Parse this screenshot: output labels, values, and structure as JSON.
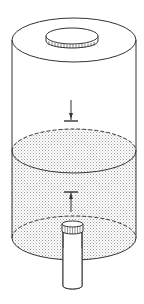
{
  "diagram": {
    "title": "Cylinder partially filled with liquid, with cap on top and outlet pipe at bottom",
    "colors": {
      "stroke": "#333333",
      "liquid_fill": "#d9d9d9",
      "background": "#ffffff"
    },
    "parts": [
      {
        "id": "cap",
        "label": "knurled cap"
      },
      {
        "id": "cylinder",
        "label": "cylindrical tank"
      },
      {
        "id": "arrow-down",
        "label": "downward force arrow"
      },
      {
        "id": "liquid-surface",
        "label": "liquid surface"
      },
      {
        "id": "arrow-up",
        "label": "upward force arrow"
      },
      {
        "id": "outlet-pipe",
        "label": "outlet pipe"
      }
    ]
  }
}
